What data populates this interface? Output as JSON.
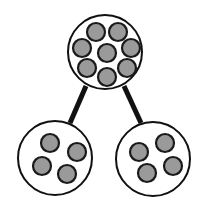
{
  "diagram": {
    "type": "tree",
    "colors": {
      "background": "#ffffff",
      "outline": "#111111",
      "particle_fill": "#9a9a9a",
      "particle_stroke": "#1a1a1a",
      "edge": "#111111"
    },
    "nodes": [
      {
        "id": "parent",
        "cx": 105,
        "cy": 52,
        "r": 37,
        "particle_count": 8,
        "particles": [
          {
            "cx": 96,
            "cy": 32
          },
          {
            "cx": 118,
            "cy": 32
          },
          {
            "cx": 82,
            "cy": 48
          },
          {
            "cx": 107,
            "cy": 53
          },
          {
            "cx": 131,
            "cy": 48
          },
          {
            "cx": 87,
            "cy": 68
          },
          {
            "cx": 127,
            "cy": 68
          },
          {
            "cx": 107,
            "cy": 77
          }
        ]
      },
      {
        "id": "child-left",
        "cx": 55,
        "cy": 158,
        "r": 37,
        "particle_count": 4,
        "particles": [
          {
            "cx": 50,
            "cy": 143
          },
          {
            "cx": 77,
            "cy": 152
          },
          {
            "cx": 42,
            "cy": 166
          },
          {
            "cx": 67,
            "cy": 174
          }
        ]
      },
      {
        "id": "child-right",
        "cx": 153,
        "cy": 159,
        "r": 37,
        "particle_count": 4,
        "particles": [
          {
            "cx": 165,
            "cy": 143
          },
          {
            "cx": 139,
            "cy": 152
          },
          {
            "cx": 173,
            "cy": 166
          },
          {
            "cx": 147,
            "cy": 173
          }
        ]
      }
    ],
    "edges": [
      {
        "from": "parent",
        "to": "child-left",
        "x1": 86,
        "y1": 86,
        "x2": 70,
        "y2": 123
      },
      {
        "from": "parent",
        "to": "child-right",
        "x1": 124,
        "y1": 86,
        "x2": 141,
        "y2": 123
      }
    ],
    "particle_radius": 9
  }
}
